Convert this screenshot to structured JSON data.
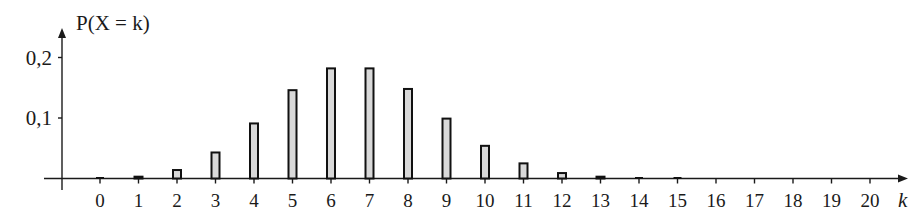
{
  "chart_data": {
    "type": "bar",
    "title": "P(X = k)",
    "xlabel": "k",
    "ylabel": "P(X = k)",
    "categories": [
      "0",
      "1",
      "2",
      "3",
      "4",
      "5",
      "6",
      "7",
      "8",
      "9",
      "10",
      "11",
      "12",
      "13",
      "14",
      "15",
      "16",
      "17",
      "18",
      "19",
      "20"
    ],
    "values": [
      0.0003,
      0.003,
      0.014,
      0.043,
      0.091,
      0.146,
      0.182,
      0.182,
      0.148,
      0.099,
      0.054,
      0.025,
      0.009,
      0.003,
      0.0007,
      0.0001,
      0.0,
      0.0,
      0.0,
      0.0,
      0.0
    ],
    "y_ticks": [
      0.1,
      0.2
    ],
    "y_tick_labels": [
      "0,1",
      "0,2"
    ],
    "ylim": [
      0,
      0.25
    ],
    "grid": false,
    "legend": null,
    "colors": {
      "bar_fill": "#d9d9d9",
      "bar_stroke": "#111111",
      "axis": "#1a1a1a"
    }
  }
}
